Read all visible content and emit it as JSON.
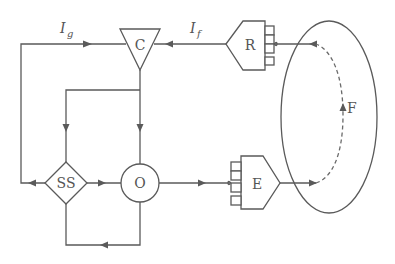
{
  "diagram": {
    "nodes": {
      "C": {
        "label": "C",
        "shape": "inverted-triangle"
      },
      "R": {
        "label": "R",
        "shape": "pentagon-receptor"
      },
      "SS": {
        "label": "SS",
        "shape": "diamond"
      },
      "O": {
        "label": "O",
        "shape": "circle"
      },
      "E": {
        "label": "E",
        "shape": "pentagon-effector"
      },
      "F": {
        "label": "F",
        "shape": "ellipse-field"
      }
    },
    "signals": {
      "Ig": {
        "main": "I",
        "sub": "g"
      },
      "If": {
        "main": "I",
        "sub": "f"
      }
    },
    "edges": [
      {
        "from": "SS",
        "to": "C",
        "label": "Ig",
        "route": "left loop"
      },
      {
        "from": "R",
        "to": "C",
        "label": "If"
      },
      {
        "from": "C",
        "to": "SS"
      },
      {
        "from": "C",
        "to": "O"
      },
      {
        "from": "SS",
        "to": "O"
      },
      {
        "from": "O",
        "to": "SS",
        "route": "bottom loop"
      },
      {
        "from": "O",
        "to": "E"
      },
      {
        "from": "E",
        "to": "F"
      },
      {
        "from": "F",
        "to": "R",
        "style": "dashed"
      }
    ]
  }
}
